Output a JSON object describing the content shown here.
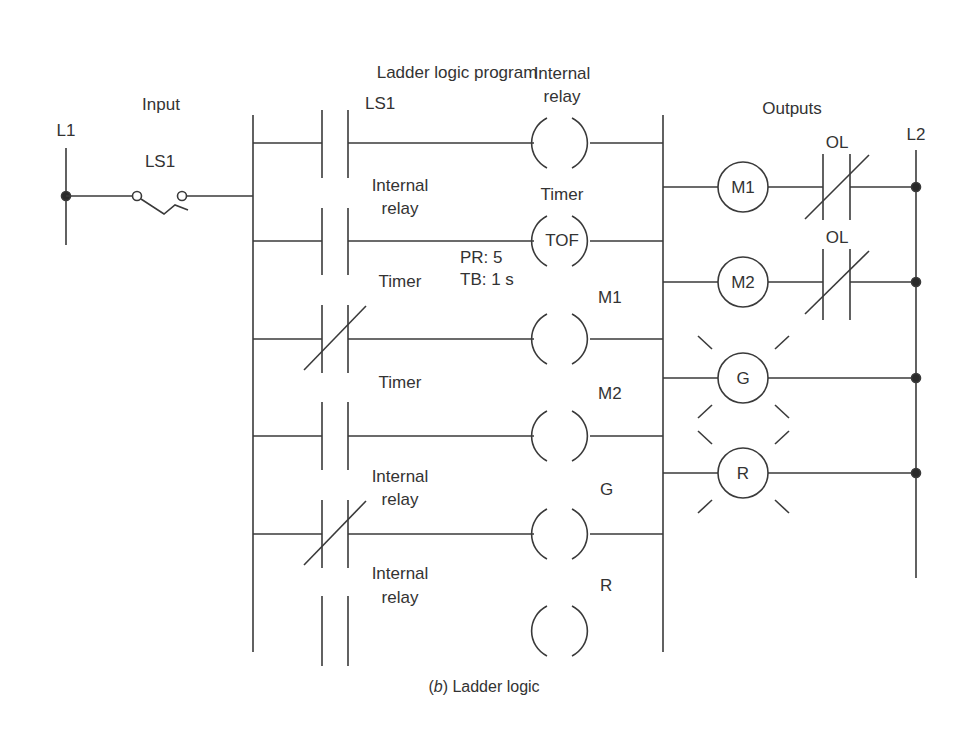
{
  "title": "Ladder logic program",
  "caption": {
    "prefix": "(",
    "letter": "b",
    "suffix": ") Ladder logic"
  },
  "input_section": {
    "heading": "Input",
    "rail_label": "L1",
    "switch_label": "LS1"
  },
  "program": {
    "rungs": [
      {
        "contact_label": [
          "LS1"
        ],
        "contact_type": "NO",
        "coil_label": [
          "Internal",
          "relay"
        ],
        "coil_text": ""
      },
      {
        "contact_label": [
          "Internal",
          "relay"
        ],
        "contact_type": "NO",
        "coil_label": [
          "Timer"
        ],
        "coil_text": "TOF",
        "params": [
          "PR:  5",
          "TB: 1 s"
        ]
      },
      {
        "contact_label": [
          "Timer"
        ],
        "contact_type": "NC",
        "coil_label": [
          "M1"
        ],
        "coil_text": ""
      },
      {
        "contact_label": [
          "Timer"
        ],
        "contact_type": "NO",
        "coil_label": [
          "M2"
        ],
        "coil_text": ""
      },
      {
        "contact_label": [
          "Internal",
          "relay"
        ],
        "contact_type": "NC",
        "coil_label": [
          "G"
        ],
        "coil_text": ""
      },
      {
        "contact_label": [
          "Internal",
          "relay"
        ],
        "contact_type": "NO",
        "coil_label": [
          "R"
        ],
        "coil_text": ""
      }
    ]
  },
  "outputs": {
    "heading": "Outputs",
    "rail_label": "L2",
    "devices": [
      {
        "name": "M1",
        "type": "motor-starter",
        "overload": "OL"
      },
      {
        "name": "M2",
        "type": "motor-starter",
        "overload": "OL"
      },
      {
        "name": "G",
        "type": "pilot-light"
      },
      {
        "name": "R",
        "type": "pilot-light"
      }
    ]
  },
  "colors": {
    "line": "#3a3a3a",
    "text": "#333333",
    "background": "#ffffff"
  }
}
